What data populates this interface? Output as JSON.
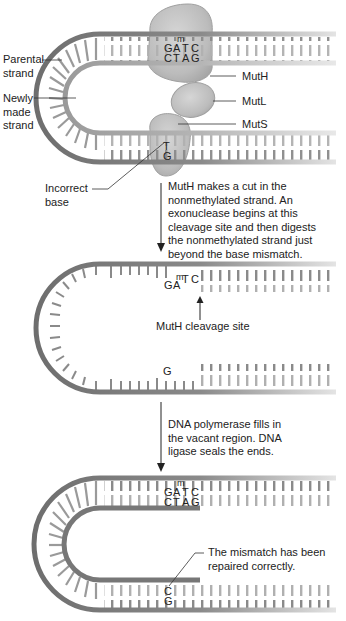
{
  "figure": {
    "domain": "DNA mismatch repair (methyl-directed)",
    "colors": {
      "parental_strand": "#6e6e6e",
      "new_strand": "#8c8c8c",
      "faded_strand": "#cfcfcf",
      "protein_fill": "#bdbdbd",
      "protein_edge": "#9a9a9a",
      "text": "#222222"
    }
  },
  "panel1": {
    "labels": {
      "parental_strand": "Parental\nstrand",
      "newly_made_strand": "Newly\nmade\nstrand",
      "incorrect_base": "Incorrect\nbase",
      "muth": "MutH",
      "mutl": "MutL",
      "muts": "MutS"
    },
    "gatc_top": [
      "G",
      "A",
      "T",
      "C"
    ],
    "gatc_bottom": [
      "C",
      "T",
      "A",
      "G"
    ],
    "methyl_mark": "m",
    "mismatch_top": "T",
    "mismatch_bottom": "G"
  },
  "step1": {
    "text": "MutH makes a cut in the\nnonmethylated strand. An\nexonuclease begins at this\ncleavage site and then digests\nthe nonmethylated strand just\nbeyond the base mismatch."
  },
  "panel2": {
    "gatc_remaining": [
      "G",
      "A",
      "T",
      "C"
    ],
    "methyl_mark": "m",
    "bottom_base": "G",
    "cleavage_label": "MutH cleavage site"
  },
  "step2": {
    "text": "DNA polymerase fills in\nthe vacant region. DNA\nligase seals the ends."
  },
  "panel3": {
    "gatc_top": [
      "G",
      "A",
      "T",
      "C"
    ],
    "gatc_bottom": [
      "C",
      "T",
      "A",
      "G"
    ],
    "methyl_mark": "m",
    "repaired_top": "C",
    "repaired_bottom": "G",
    "repaired_label": "The mismatch has been\nrepaired correctly."
  }
}
